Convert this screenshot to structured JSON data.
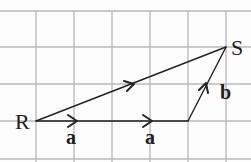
{
  "diagram": {
    "type": "vector-diagram-on-grid",
    "grid": {
      "x_lines": [
        36,
        74,
        112,
        150,
        188,
        226
      ],
      "y_lines": [
        11,
        47,
        84,
        121,
        159
      ],
      "color": "#b8b8b8"
    },
    "points": [
      {
        "label": "R",
        "x": 36,
        "y": 121
      },
      {
        "label": "S",
        "x": 226,
        "y": 47
      }
    ],
    "vectors": [
      {
        "label": "a",
        "from": [
          36,
          121
        ],
        "to": [
          112,
          121
        ],
        "bold": true
      },
      {
        "label": "a",
        "from": [
          112,
          121
        ],
        "to": [
          188,
          121
        ],
        "bold": true
      },
      {
        "label": "b",
        "from": [
          188,
          121
        ],
        "to": [
          226,
          47
        ],
        "bold": true
      },
      {
        "label": "",
        "from": [
          36,
          121
        ],
        "to": [
          226,
          47
        ],
        "note": "resultant R to S"
      }
    ],
    "labels": {
      "R": "R",
      "S": "S",
      "a1": "a",
      "a2": "a",
      "b": "b"
    }
  }
}
